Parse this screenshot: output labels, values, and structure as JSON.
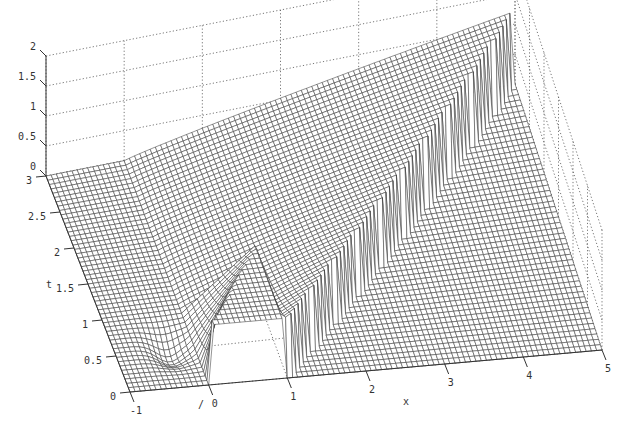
{
  "chart_data": {
    "type": "surface3d",
    "title": "",
    "xlabel": "x",
    "ylabel": "t",
    "zlabel": "",
    "x_ticks": [
      "-1",
      "0",
      "1",
      "2",
      "3",
      "4",
      "5"
    ],
    "y_ticks": [
      "0",
      "0.5",
      "1",
      "1.5",
      "2",
      "2.5",
      "3"
    ],
    "z_ticks": [
      "0",
      "0.5",
      "1",
      "1.5",
      "2"
    ],
    "xlim": [
      -1,
      5
    ],
    "ylim": [
      0,
      3
    ],
    "zlim": [
      0,
      2
    ],
    "grid": true,
    "features": [
      {
        "name": "initial_box",
        "x_range": [
          0,
          1
        ],
        "t": 0,
        "height": 1.0
      },
      {
        "name": "shock_front",
        "from": [
          1,
          0
        ],
        "to": [
          5,
          3
        ],
        "max_height": 1.2
      },
      {
        "name": "left_dip",
        "x": -0.5,
        "t": 0.6,
        "height": -0.15
      }
    ]
  },
  "axes": {
    "x_label": "x",
    "t_label": "t"
  },
  "stray_mark": "/"
}
